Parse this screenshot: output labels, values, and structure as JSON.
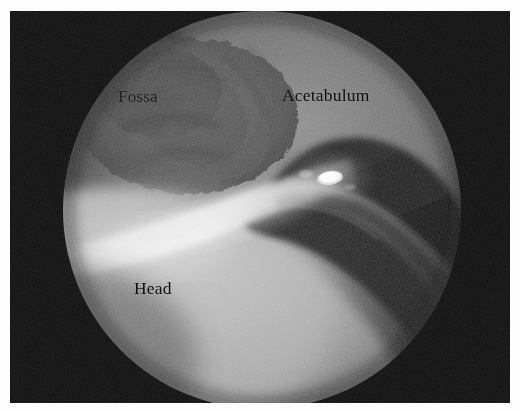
{
  "figure": {
    "kind": "arthroscopic-photograph",
    "modality": "hip arthroscopy",
    "view_shape": "circular endoscopic field",
    "background_color": "#070707",
    "page_color": "#fdfdfd"
  },
  "annotations": [
    {
      "id": "fossa",
      "text": "Fossa",
      "describes": "acetabular fossa",
      "color": "#1b1b1b"
    },
    {
      "id": "acetabulum",
      "text": "Acetabulum",
      "describes": "acetabular articular surface",
      "color": "#0e0e0e"
    },
    {
      "id": "head",
      "text": "Head",
      "describes": "femoral head",
      "color": "#101010"
    }
  ],
  "scene": {
    "circle": {
      "center_x": 252,
      "center_y": 199,
      "radius": 199
    },
    "regions": [
      {
        "name": "acetabulum-surface",
        "tone": "#7a7a7a",
        "position": "upper right of field"
      },
      {
        "name": "acetabular-fossa",
        "tone": "#4e4e4e",
        "position": "upper left of field"
      },
      {
        "name": "femoral-head",
        "tone": "#b4b4b4",
        "position": "lower left, large bright dome"
      },
      {
        "name": "labrum-recess",
        "tone": "#1d1d1d",
        "position": "right, dark curved cleft"
      }
    ],
    "specular_highlight": {
      "name": "light-reflection",
      "center_x": 320,
      "center_y": 167,
      "rx": 13,
      "ry": 7,
      "color": "#ffffff"
    }
  }
}
